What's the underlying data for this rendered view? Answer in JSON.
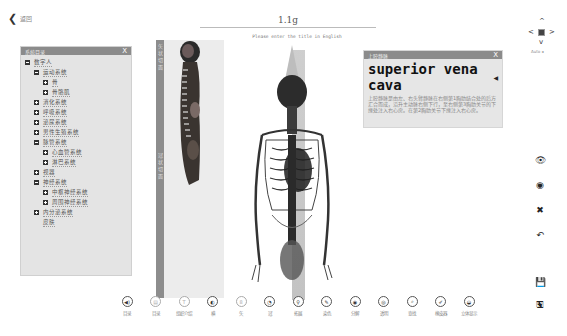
{
  "header": {
    "back_label": "返回",
    "title": "1.1g",
    "subtitle": "Please enter the title in English"
  },
  "tree_panel": {
    "title": "系统目录",
    "close": "X",
    "items": [
      {
        "label": "数字人",
        "level": 0,
        "state": "expanded"
      },
      {
        "label": "运动系统",
        "level": 1,
        "state": "expanded"
      },
      {
        "label": "骨",
        "level": 2,
        "state": "collapsed"
      },
      {
        "label": "骨骼肌",
        "level": 2,
        "state": "collapsed"
      },
      {
        "label": "消化系统",
        "level": 1,
        "state": "collapsed"
      },
      {
        "label": "呼吸系统",
        "level": 1,
        "state": "collapsed"
      },
      {
        "label": "泌尿系统",
        "level": 1,
        "state": "collapsed"
      },
      {
        "label": "男性生殖系统",
        "level": 1,
        "state": "collapsed"
      },
      {
        "label": "脉管系统",
        "level": 1,
        "state": "expanded"
      },
      {
        "label": "心血管系统",
        "level": 2,
        "state": "collapsed"
      },
      {
        "label": "淋巴系统",
        "level": 2,
        "state": "collapsed"
      },
      {
        "label": "视器",
        "level": 1,
        "state": "collapsed"
      },
      {
        "label": "神经系统",
        "level": 1,
        "state": "expanded"
      },
      {
        "label": "中枢神经系统",
        "level": 2,
        "state": "collapsed"
      },
      {
        "label": "周围神经系统",
        "level": 2,
        "state": "collapsed"
      },
      {
        "label": "内分泌系统",
        "level": 1,
        "state": "collapsed"
      },
      {
        "label": "皮肤",
        "level": 1,
        "state": "leaf"
      }
    ]
  },
  "strip": {
    "top_text": "矢状切面",
    "mid_text": "冠状切面"
  },
  "info_panel": {
    "header": "上腔静脉",
    "close": "X",
    "title": "superior vena cava",
    "speaker_icon": "◀",
    "description": "上腔静脉是由左、右头臂静脉在右侧第1胸肋结合处的后方汇合而成，沿升主动脉右侧下行，至右侧第3胸肋关节的下缘处注入右心房。在第2胸肋关节下缘注入右心房。"
  },
  "nav_control": {
    "up": "^",
    "down": "v",
    "left": "<",
    "right": ">",
    "auto_label": "Auto ◂"
  },
  "right_tools": [
    {
      "name": "show-icon",
      "glyph": "👁"
    },
    {
      "name": "hide-icon",
      "glyph": "◉"
    },
    {
      "name": "delete-icon",
      "glyph": "✖"
    },
    {
      "name": "undo-icon",
      "glyph": "↶"
    },
    {
      "name": "save-icon",
      "glyph": "💾"
    },
    {
      "name": "save-as-icon",
      "glyph": "🖫"
    }
  ],
  "toolbar": [
    {
      "label": "目录",
      "glyph": "◀)",
      "x": 0
    },
    {
      "label": "目录",
      "glyph": "▤",
      "x": 33,
      "light": true
    },
    {
      "label": "组织介绍",
      "glyph": "T",
      "x": 75,
      "light": true
    },
    {
      "label": "横",
      "glyph": "◐",
      "x": 85
    },
    {
      "label": "矢",
      "glyph": "8",
      "x": 118,
      "light": true
    },
    {
      "label": "冠",
      "glyph": "◔",
      "x": 148
    },
    {
      "label": "拓展",
      "glyph": "♀",
      "x": 175
    },
    {
      "label": "染色",
      "glyph": "✎",
      "x": 201
    },
    {
      "label": "分解",
      "glyph": "◉",
      "x": 229
    },
    {
      "label": "透明",
      "glyph": "◎",
      "x": 257
    },
    {
      "label": "查找",
      "glyph": "⌕",
      "x": 285
    },
    {
      "label": "橡皮器",
      "glyph": "✐",
      "x": 313
    },
    {
      "label": "立体显示",
      "glyph": "◒",
      "x": 340
    }
  ]
}
